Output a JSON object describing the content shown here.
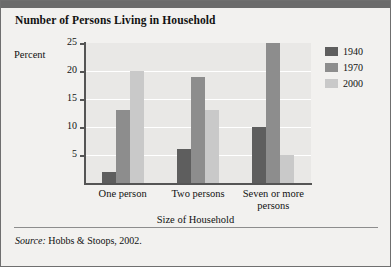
{
  "title": "Number of Persons Living in Household",
  "percent_label": "Percent",
  "source": {
    "prefix": "Source:",
    "text": "Hobbs & Stoops, 2002."
  },
  "legend": {
    "items": [
      {
        "label": "1940",
        "color": "#5e5e5e"
      },
      {
        "label": "1970",
        "color": "#8d8d8d"
      },
      {
        "label": "2000",
        "color": "#c9c9c9"
      }
    ]
  },
  "chart_data": {
    "type": "bar",
    "title": "Number of Persons Living in Household",
    "xlabel": "Size of Household",
    "ylabel": "Percent",
    "categories": [
      "One person",
      "Two persons",
      "Seven or more persons"
    ],
    "series": [
      {
        "name": "1940",
        "values": [
          2,
          6,
          10
        ]
      },
      {
        "name": "1970",
        "values": [
          13,
          19,
          25
        ]
      },
      {
        "name": "2000",
        "values": [
          20,
          13,
          5
        ]
      }
    ],
    "ylim": [
      0,
      25
    ],
    "yticks": [
      5,
      10,
      15,
      20,
      25
    ],
    "ytick_labels": [
      "5",
      "10",
      "15",
      "20",
      "25"
    ],
    "grid": true,
    "legend_position": "right"
  }
}
